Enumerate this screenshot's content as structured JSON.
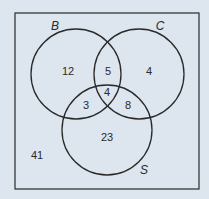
{
  "diagram": {
    "type": "venn",
    "background_color": "#dde5ee",
    "line_color": "#2a2a2a",
    "universe": {
      "rect": {
        "x": 15,
        "y": 13,
        "width": 184,
        "height": 176
      },
      "outside_count": "41",
      "outside_pos": {
        "x": 37,
        "y": 159
      }
    },
    "sets": [
      {
        "name": "B",
        "label": "B",
        "cx": 76,
        "cy": 74,
        "r": 45,
        "label_pos": {
          "x": 55,
          "y": 30
        }
      },
      {
        "name": "C",
        "label": "C",
        "cx": 139,
        "cy": 74,
        "r": 45,
        "label_pos": {
          "x": 160,
          "y": 30
        }
      },
      {
        "name": "S",
        "label": "S",
        "cx": 107,
        "cy": 130,
        "r": 45,
        "label_pos": {
          "x": 144,
          "y": 174
        }
      }
    ],
    "regions": [
      {
        "id": "B-only",
        "value": "12",
        "x": 68,
        "y": 75
      },
      {
        "id": "B-and-C-only",
        "value": "5",
        "x": 108,
        "y": 75
      },
      {
        "id": "C-only",
        "value": "4",
        "x": 149,
        "y": 75
      },
      {
        "id": "B-and-C-and-S",
        "value": "4",
        "x": 107,
        "y": 96
      },
      {
        "id": "B-and-S-only",
        "value": "3",
        "x": 86,
        "y": 109
      },
      {
        "id": "C-and-S-only",
        "value": "8",
        "x": 128,
        "y": 109
      },
      {
        "id": "S-only",
        "value": "23",
        "x": 107,
        "y": 141
      }
    ]
  }
}
